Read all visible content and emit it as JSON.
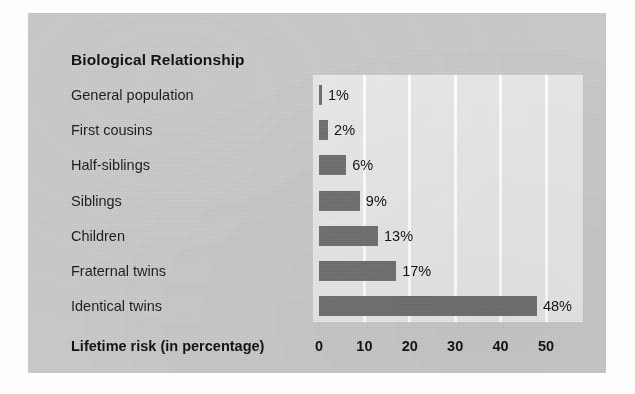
{
  "figure": {
    "title": "Biological Relationship",
    "xaxis_title": "Lifetime risk (in percentage)"
  },
  "colors": {
    "panel_background": "#c9c9c9",
    "plot_background": "#e6e6e6",
    "bar_fill": "#6f6f6f",
    "gridline": "#fbfbfb",
    "text": "#141414"
  },
  "chart_data": {
    "type": "bar",
    "orientation": "horizontal",
    "title": "Biological Relationship",
    "subtitle": "",
    "xlabel": "Lifetime risk (in percentage)",
    "ylabel": "Biological Relationship",
    "xlim": [
      0,
      50
    ],
    "xticks": [
      0,
      10,
      20,
      30,
      40,
      50
    ],
    "xtick_labels": [
      "0",
      "10",
      "20",
      "30",
      "40",
      "50"
    ],
    "grid": "vertical",
    "legend": "none",
    "categories": [
      "General population",
      "First cousins",
      "Half-siblings",
      "Siblings",
      "Children",
      "Fraternal twins",
      "Identical twins"
    ],
    "values": [
      1,
      2,
      6,
      9,
      13,
      17,
      48
    ],
    "data_labels": [
      "1%",
      "2%",
      "6%",
      "9%",
      "13%",
      "17%",
      "48%"
    ],
    "units": "percent"
  },
  "rows": [
    {
      "label": "General population",
      "value": 1,
      "data_label": "1%"
    },
    {
      "label": "First cousins",
      "value": 2,
      "data_label": "2%"
    },
    {
      "label": "Half-siblings",
      "value": 6,
      "data_label": "6%"
    },
    {
      "label": "Siblings",
      "value": 9,
      "data_label": "9%"
    },
    {
      "label": "Children",
      "value": 13,
      "data_label": "13%"
    },
    {
      "label": "Fraternal twins",
      "value": 17,
      "data_label": "17%"
    },
    {
      "label": "Identical twins",
      "value": 48,
      "data_label": "48%"
    }
  ],
  "ticks": [
    {
      "label": "0",
      "value": 0
    },
    {
      "label": "10",
      "value": 10
    },
    {
      "label": "20",
      "value": 20
    },
    {
      "label": "30",
      "value": 30
    },
    {
      "label": "40",
      "value": 40
    },
    {
      "label": "50",
      "value": 50
    }
  ]
}
